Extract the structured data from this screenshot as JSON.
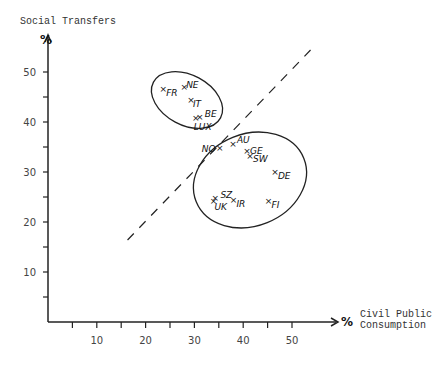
{
  "chart_data": {
    "type": "scatter",
    "title": "",
    "ylabel": "Social Transfers",
    "xlabel_line1": "Civil Public",
    "xlabel_line2": "Consumption",
    "y_unit": "%",
    "x_unit": "%",
    "xlim": [
      0,
      58
    ],
    "ylim": [
      0,
      55
    ],
    "x_ticks": [
      5,
      10,
      15,
      20,
      25,
      30,
      35,
      40,
      45,
      50
    ],
    "x_tick_labels": [
      "10",
      "20",
      "30",
      "40",
      "50"
    ],
    "y_ticks": [
      5,
      10,
      15,
      20,
      25,
      30,
      35,
      40,
      45,
      50
    ],
    "y_tick_labels": [
      "10",
      "20",
      "30",
      "40",
      "50"
    ],
    "grid": false,
    "points": [
      {
        "label": "FR",
        "x": 23.6,
        "y": 46.4
      },
      {
        "label": "NE",
        "x": 27.9,
        "y": 46.8
      },
      {
        "label": "IT",
        "x": 29.3,
        "y": 44.2
      },
      {
        "label": "BE",
        "x": 31.1,
        "y": 40.8
      },
      {
        "label": "LUX",
        "x": 30.3,
        "y": 40.6
      },
      {
        "label": "NO",
        "x": 35.2,
        "y": 34.6
      },
      {
        "label": "AU",
        "x": 37.9,
        "y": 35.4
      },
      {
        "label": "GE",
        "x": 40.8,
        "y": 34.0
      },
      {
        "label": "SW",
        "x": 41.4,
        "y": 33.0
      },
      {
        "label": "DE",
        "x": 46.5,
        "y": 29.8
      },
      {
        "label": "SZ",
        "x": 34.3,
        "y": 24.6
      },
      {
        "label": "UK",
        "x": 33.9,
        "y": 24.0
      },
      {
        "label": "IR",
        "x": 38.0,
        "y": 24.2
      },
      {
        "label": "FI",
        "x": 45.2,
        "y": 24.0
      }
    ],
    "groups": [
      {
        "name": "cluster-upper",
        "members": [
          "FR",
          "NE",
          "IT",
          "BE",
          "LUX"
        ]
      },
      {
        "name": "cluster-lower",
        "members": [
          "NO",
          "AU",
          "GE",
          "SW",
          "DE",
          "SZ",
          "UK",
          "IR",
          "FI"
        ]
      }
    ],
    "reference_line": {
      "style": "dashed",
      "from": {
        "x": 16.3,
        "y": 16.4
      },
      "to": {
        "x": 53.8,
        "y": 54.4
      }
    }
  }
}
